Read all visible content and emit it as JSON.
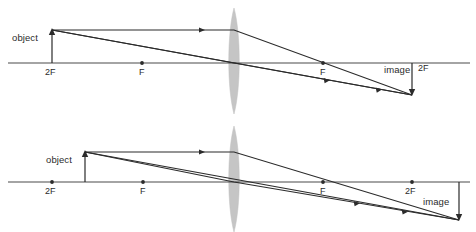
{
  "figure": {
    "colors": {
      "ink": "#2b2b2b",
      "axis": "#4a4a4a",
      "lens_fill": "#c2c2c2",
      "background": "#ffffff"
    }
  },
  "diagrams": [
    {
      "id": "top",
      "name": "object-at-2F",
      "labels": {
        "object": "object",
        "image": "image",
        "focal_left": "F",
        "focal_right": "F",
        "double_focal_left": "2F",
        "double_focal_right": "2F"
      },
      "geometry": {
        "axis_y": 63,
        "axis_x_start": 8,
        "axis_x_end": 470,
        "lens_x": 234,
        "lens_top_y": 8,
        "lens_bottom_y": 114,
        "lens_half_width": 6,
        "object_x": 52,
        "object_top_y": 30,
        "image_x": 412,
        "image_bottom_y": 95,
        "f_left_x": 142,
        "f_right_x": 323,
        "two_f_left_x": 52,
        "two_f_right_x": 412
      }
    },
    {
      "id": "bottom",
      "name": "object-between-2F-and-F",
      "labels": {
        "object": "object",
        "image": "image",
        "focal_left": "F",
        "focal_right": "F",
        "double_focal_left": "2F",
        "double_focal_right": "2F"
      },
      "geometry": {
        "axis_y": 66,
        "axis_x_start": 8,
        "axis_x_end": 470,
        "lens_x": 234,
        "lens_top_y": 10,
        "lens_bottom_y": 116,
        "lens_half_width": 6,
        "object_x": 85,
        "object_top_y": 36,
        "image_x": 459,
        "image_bottom_y": 104,
        "f_left_x": 143,
        "f_right_x": 323,
        "two_f_left_x": 52,
        "two_f_right_x": 412
      }
    }
  ]
}
